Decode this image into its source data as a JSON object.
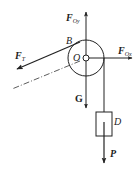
{
  "diagram": {
    "type": "free-body diagram",
    "colors": {
      "stroke": "#222222",
      "background": "#ffffff"
    },
    "labels": {
      "force_Oy": {
        "main": "F",
        "sub": "Oy"
      },
      "force_Ox": {
        "main": "F",
        "sub": "Ox"
      },
      "force_T": {
        "main": "F",
        "sub": "T"
      },
      "point_B": "B",
      "point_O": "O",
      "gravity": "G",
      "block": "D",
      "load": "P"
    },
    "elements": [
      {
        "name": "pulley",
        "shape": "circle",
        "center": "O"
      },
      {
        "name": "rope-to-block",
        "from": "pulley right edge",
        "to": "D"
      },
      {
        "name": "tension-line",
        "from": "B",
        "direction": "down-left"
      },
      {
        "name": "center-dash-dot-line",
        "from": "O",
        "direction": "down-left"
      }
    ]
  }
}
